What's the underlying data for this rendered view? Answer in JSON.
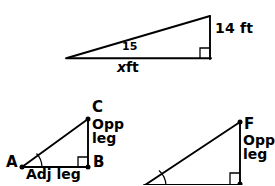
{
  "figure": {
    "background_color": "#ffffff",
    "stroke_color": "#000000"
  },
  "top_triangle": {
    "name": "elevation-right-triangle",
    "angle_label": "15",
    "vertical_side_label": "14 ft",
    "base_side_label_variable": "x",
    "base_side_label_unit": "ft",
    "right_angle_marker": "right-angle-square",
    "vertices": {
      "left_apex": [
        67,
        58
      ],
      "top_right": [
        210,
        16
      ],
      "bottom_right": [
        210,
        58
      ]
    }
  },
  "triangle_abc": {
    "name": "triangle-abc",
    "vertex_a_label": "A",
    "vertex_b_label": "B",
    "vertex_c_label": "C",
    "opposite_leg_line1": "Opp",
    "opposite_leg_line2": "leg",
    "adjacent_leg_label": "Adj leg",
    "right_angle_marker": "right-angle-square",
    "angle_arc_at": "A",
    "vertices": {
      "a": [
        22,
        167
      ],
      "b": [
        88,
        167
      ],
      "c": [
        88,
        119
      ]
    }
  },
  "triangle_def": {
    "name": "triangle-def",
    "vertex_f_label": "F",
    "opposite_leg_line1": "Opp",
    "opposite_leg_line2": "leg",
    "right_angle_marker": "right-angle-square",
    "angle_arc_at": "left-vertex",
    "clipped": "bottom edge of image",
    "vertices": {
      "left": [
        145,
        185
      ],
      "top_f": [
        240,
        122
      ],
      "bottom_right": [
        240,
        185
      ]
    }
  }
}
